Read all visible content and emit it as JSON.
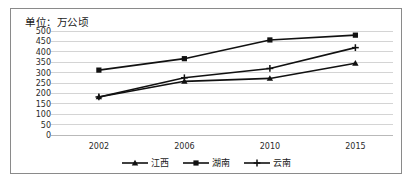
{
  "chart_data": {
    "type": "line",
    "title": "单位：万公顷",
    "xlabel": "",
    "ylabel": "",
    "categories": [
      "2002",
      "2006",
      "2010",
      "2015"
    ],
    "series": [
      {
        "name": "江西",
        "marker": "triangle",
        "values": [
          183,
          258,
          272,
          345
        ]
      },
      {
        "name": "湖南",
        "marker": "square",
        "values": [
          312,
          367,
          457,
          480
        ]
      },
      {
        "name": "云南",
        "marker": "plus",
        "values": [
          183,
          275,
          320,
          420
        ]
      }
    ],
    "ylim": [
      0,
      500
    ],
    "yticks": [
      0,
      50,
      100,
      150,
      200,
      250,
      300,
      350,
      400,
      450,
      500
    ],
    "grid": true,
    "legend_position": "bottom",
    "line_color": "#111111",
    "grid_color": "#d4d4d4",
    "border_color": "#8a8a8a"
  }
}
